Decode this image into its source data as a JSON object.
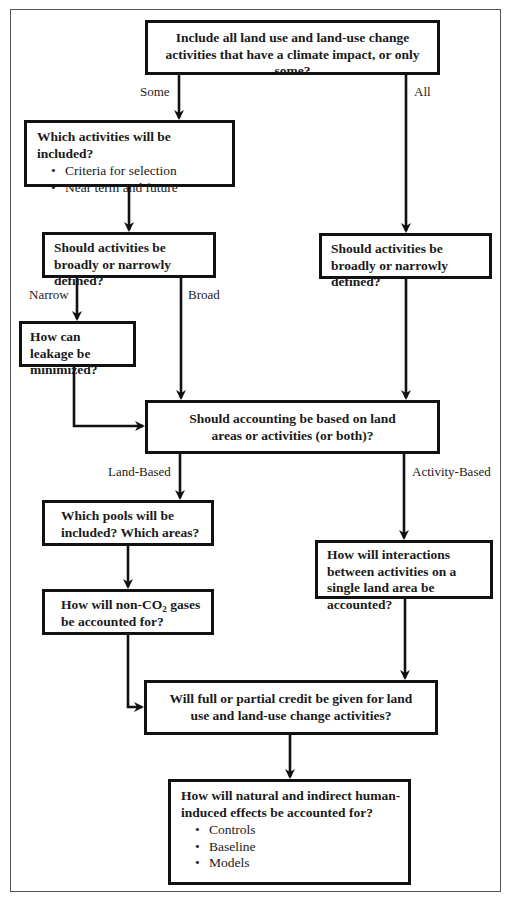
{
  "diagram": {
    "type": "flowchart",
    "nodes": {
      "scope": {
        "question": "Include all land use and land-use change activities that have a climate impact, or only some?"
      },
      "which_activities": {
        "question": "Which activities will be included?",
        "bullets": [
          "Criteria for selection",
          "Near term and future"
        ]
      },
      "definition_left": {
        "question": "Should activities be broadly or narrowly defined?"
      },
      "definition_right": {
        "question": "Should activities be broadly or narrowly defined?"
      },
      "leakage": {
        "question": "How can leakage be minimized?"
      },
      "accounting_basis": {
        "question": "Should accounting be based on land areas or activities (or both)?"
      },
      "pools": {
        "question": "Which pools will be included? Which areas?"
      },
      "non_co2": {
        "question_prefix": "How will non-CO",
        "question_sub": "2",
        "question_suffix": " gases be accounted for?"
      },
      "interactions": {
        "question": "How will interactions between activities on a single land area be accounted?"
      },
      "credit": {
        "question": "Will full or partial credit be given for land use and land-use change activities?"
      },
      "natural_effects": {
        "question": "How will natural and indirect human-induced effects be accounted for?",
        "bullets": [
          "Controls",
          "Baseline",
          "Models"
        ]
      }
    },
    "edge_labels": {
      "some": "Some",
      "all": "All",
      "narrow": "Narrow",
      "broad": "Broad",
      "land_based": "Land-Based",
      "activity_based": "Activity-Based"
    },
    "edges": [
      {
        "from": "scope",
        "to": "which_activities",
        "label": "Some"
      },
      {
        "from": "scope",
        "to": "definition_right",
        "label": "All"
      },
      {
        "from": "which_activities",
        "to": "definition_left",
        "label": ""
      },
      {
        "from": "definition_left",
        "to": "leakage",
        "label": "Narrow"
      },
      {
        "from": "definition_left",
        "to": "accounting_basis",
        "label": "Broad"
      },
      {
        "from": "leakage",
        "to": "accounting_basis",
        "label": ""
      },
      {
        "from": "definition_right",
        "to": "accounting_basis",
        "label": ""
      },
      {
        "from": "accounting_basis",
        "to": "pools",
        "label": "Land-Based"
      },
      {
        "from": "accounting_basis",
        "to": "interactions",
        "label": "Activity-Based"
      },
      {
        "from": "pools",
        "to": "non_co2",
        "label": ""
      },
      {
        "from": "non_co2",
        "to": "credit",
        "label": ""
      },
      {
        "from": "interactions",
        "to": "credit",
        "label": ""
      },
      {
        "from": "credit",
        "to": "natural_effects",
        "label": ""
      }
    ],
    "colors": {
      "line": "#111111",
      "frame": "#555555",
      "background": "#ffffff"
    }
  }
}
